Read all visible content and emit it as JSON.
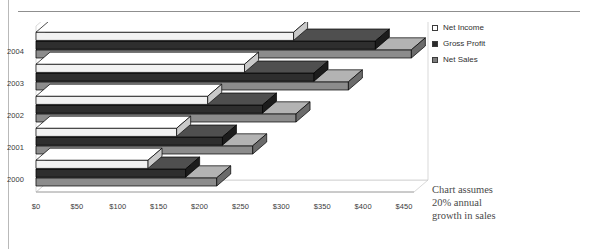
{
  "chart_data": {
    "type": "bar",
    "orientation": "horizontal",
    "title": "",
    "xlabel": "",
    "ylabel": "",
    "categories": [
      "2000",
      "2001",
      "2002",
      "2003",
      "2004"
    ],
    "series": [
      {
        "name": "Net Sales",
        "values": [
          221,
          265,
          318,
          382,
          459
        ]
      },
      {
        "name": "Gross Profit",
        "values": [
          183,
          228,
          277,
          340,
          415
        ]
      },
      {
        "name": "Net Income",
        "values": [
          137,
          172,
          210,
          255,
          315
        ]
      }
    ],
    "xlim": [
      0,
      450
    ],
    "xtick_values": [
      0,
      50,
      100,
      150,
      200,
      250,
      300,
      350,
      400,
      450
    ],
    "xtick_labels": [
      "$0",
      "$50",
      "$100",
      "$150",
      "$200",
      "$250",
      "$300",
      "$350",
      "$400",
      "$450"
    ],
    "grid": false,
    "legend_position": "right",
    "three_d": true,
    "annotation": "Chart assumes 20% annual growth in sales"
  },
  "legend": {
    "items": [
      {
        "label": "Net Income",
        "swatch": "legend-swatch-net-income",
        "color": "#ffffff"
      },
      {
        "label": "Gross Profit",
        "swatch": "legend-swatch-gross-profit",
        "color": "#2b2b2b"
      },
      {
        "label": "Net Sales",
        "swatch": "legend-swatch-net-sales",
        "color": "#808080"
      }
    ]
  },
  "annotation": {
    "line1": "Chart assumes",
    "line2": "20% annual",
    "line3": "growth in sales"
  },
  "axis": {
    "categories": [
      "2004",
      "2003",
      "2002",
      "2001",
      "2000"
    ],
    "xticks": [
      "$0",
      "$50",
      "$100",
      "$150",
      "$200",
      "$250",
      "$300",
      "$350",
      "$400",
      "$450"
    ]
  },
  "colors": {
    "net_income_front": "#f2f2f2",
    "net_income_top": "#ffffff",
    "net_income_side": "#c9c9c9",
    "gross_profit_front": "#2e2e2e",
    "gross_profit_top": "#4f4f4f",
    "gross_profit_side": "#1c1c1c",
    "net_sales_front": "#8c8c8c",
    "net_sales_top": "#b3b3b3",
    "net_sales_side": "#6b6b6b",
    "outline": "#000000",
    "plot_border": "#c9c9c9"
  }
}
